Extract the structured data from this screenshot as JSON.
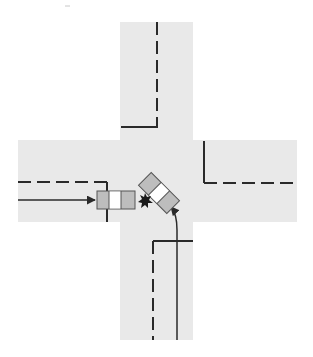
{
  "diagram": {
    "type": "intersection-collision-sketch",
    "colors": {
      "background": "#ffffff",
      "road": "#e9e9e9",
      "line": "#2a2a2a",
      "vehicle_body": "#bdbdbd",
      "vehicle_window": "#ffffff",
      "crash": "#1a1a1a"
    },
    "roads": [
      {
        "name": "vertical-road",
        "x": 120,
        "y": 22,
        "width": 73,
        "height": 318
      },
      {
        "name": "horizontal-road",
        "x": 18,
        "y": 140,
        "width": 279,
        "height": 82
      }
    ],
    "vehicles": [
      {
        "name": "vehicle-a",
        "direction": "eastbound",
        "cx": 116,
        "cy": 200,
        "length": 38,
        "width": 17,
        "angle": 0
      },
      {
        "name": "vehicle-b",
        "direction": "northwest-turning",
        "cx": 159,
        "cy": 193,
        "length": 38,
        "width": 17,
        "angle": 45
      }
    ],
    "paths": [
      {
        "name": "path-vehicle-a",
        "label": "approach from west"
      },
      {
        "name": "path-vehicle-b",
        "label": "approach from south"
      }
    ],
    "impact": {
      "name": "impact-point",
      "x": 145,
      "y": 201
    }
  }
}
